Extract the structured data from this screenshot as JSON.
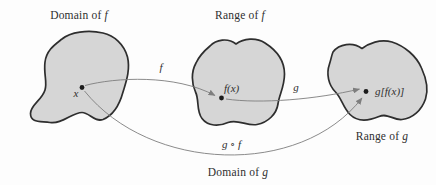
{
  "figure": {
    "colors": {
      "background": "#fdfdfd",
      "blob_fill": "#d6d6d6",
      "blob_stroke": "#2e2e2e",
      "arrow": "#7e7e7e",
      "point": "#1c1c1c",
      "text": "#2f2f2f"
    },
    "labels": {
      "domain_f": {
        "text": "Domain of",
        "symbol": "f"
      },
      "range_f": {
        "text": "Range of",
        "symbol": "f"
      },
      "range_g": {
        "text": "Range of",
        "symbol": "g"
      },
      "domain_g": {
        "text": "Domain of",
        "symbol": "g"
      }
    },
    "points": {
      "x": {
        "label": "x"
      },
      "fx": {
        "label": "f(x)"
      },
      "gfx": {
        "label": "g[f(x)]"
      }
    },
    "arrows": {
      "f": {
        "label": "f"
      },
      "g": {
        "label": "g"
      },
      "gof": {
        "left": "g",
        "op": "∘",
        "right": "f"
      }
    }
  }
}
